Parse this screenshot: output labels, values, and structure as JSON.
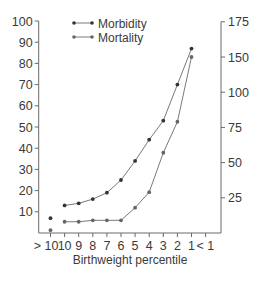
{
  "chart_data": {
    "type": "line",
    "title": "",
    "xlabel": "Birthweight percentile",
    "ylabel_left": "",
    "ylabel_right": "",
    "categories": [
      ">10",
      "10",
      "9",
      "8",
      "7",
      "6",
      "5",
      "4",
      "3",
      "2",
      "1",
      "< 1"
    ],
    "category_labels": [
      "> 10",
      "10",
      "9",
      "8",
      "7",
      "6",
      "5",
      "4",
      "3",
      "2",
      "1",
      "< 1"
    ],
    "left_axis": {
      "ticks": [
        10,
        20,
        30,
        40,
        50,
        60,
        70,
        80,
        90,
        100
      ],
      "range": [
        0,
        100
      ]
    },
    "right_axis": {
      "tick_labels": [
        "25",
        "50",
        "75",
        "100",
        "150",
        "175"
      ],
      "range": [
        0,
        175
      ]
    },
    "series": [
      {
        "name": "Morbidity",
        "axis": "left",
        "color": "#333333",
        "values": [
          7,
          13,
          14,
          16,
          19,
          25,
          34,
          44,
          53,
          70,
          87,
          null
        ],
        "connected_from_index": 1
      },
      {
        "name": "Mortality",
        "axis": "right",
        "color": "#666666",
        "values": [
          2,
          8,
          8,
          9,
          9,
          9,
          18,
          29,
          57,
          79,
          150,
          null
        ],
        "connected_from_index": 1
      }
    ],
    "legend": {
      "entries": [
        "Morbidity",
        "Mortality"
      ],
      "position": "top-left"
    },
    "grid": false
  }
}
